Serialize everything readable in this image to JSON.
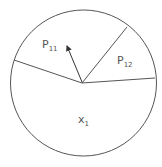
{
  "diagram": {
    "type": "partitioned-circle",
    "circle": {
      "cx": 83.5,
      "cy": 83,
      "r": 73,
      "stroke": "#555555"
    },
    "center": {
      "x": 82,
      "y": 83
    },
    "partition_lines": [
      {
        "name": "left-boundary",
        "x2": 14,
        "y2": 60
      },
      {
        "name": "upper-right-boundary",
        "x2": 127,
        "y2": 27
      },
      {
        "name": "right-boundary",
        "x2": 155,
        "y2": 78
      }
    ],
    "arrow": {
      "x2": 66,
      "y2": 44
    },
    "labels": {
      "p11": {
        "main": "P",
        "sub": "11"
      },
      "p12": {
        "main": "P",
        "sub": "12"
      },
      "x1": {
        "main": "x",
        "sub": "1"
      }
    }
  }
}
